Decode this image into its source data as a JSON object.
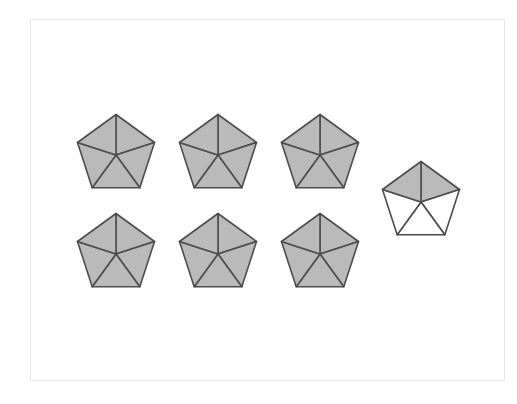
{
  "diagram": {
    "parts_per_shape": 5,
    "colors": {
      "shaded_fill": "#bababa",
      "unshaded_fill": "#ffffff",
      "stroke": "#4d4d4d",
      "frame_border": "#e6e6e6"
    },
    "shapes": [
      {
        "id": "pentagon-1",
        "row": 1,
        "col": 1,
        "shaded_parts": [
          0,
          1,
          2,
          3,
          4
        ]
      },
      {
        "id": "pentagon-2",
        "row": 1,
        "col": 2,
        "shaded_parts": [
          0,
          1,
          2,
          3,
          4
        ]
      },
      {
        "id": "pentagon-3",
        "row": 1,
        "col": 3,
        "shaded_parts": [
          0,
          1,
          2,
          3,
          4
        ]
      },
      {
        "id": "pentagon-4",
        "row": 2,
        "col": 1,
        "shaded_parts": [
          0,
          1,
          2,
          3,
          4
        ]
      },
      {
        "id": "pentagon-5",
        "row": 2,
        "col": 2,
        "shaded_parts": [
          0,
          1,
          2,
          3,
          4
        ]
      },
      {
        "id": "pentagon-6",
        "row": 2,
        "col": 3,
        "shaded_parts": [
          0,
          1,
          2,
          3,
          4
        ]
      },
      {
        "id": "pentagon-7",
        "row": 1.5,
        "col": 4,
        "shaded_parts": [
          0,
          4
        ]
      }
    ],
    "total_shaded_parts": 32,
    "fraction_represented": "32/5"
  }
}
